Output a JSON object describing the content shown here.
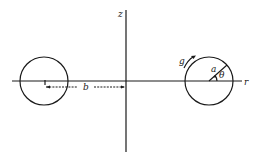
{
  "diagram": {
    "axes": {
      "vertical_label": "z",
      "horizontal_label": "r"
    },
    "left_circle": {
      "cx": 44,
      "cy": 81,
      "r": 24
    },
    "right_circle": {
      "cx": 209,
      "cy": 81,
      "r": 24
    },
    "dimension": {
      "label": "b",
      "from_x": 45,
      "to_x": 125,
      "y": 87
    },
    "right_circle_labels": {
      "flow_label": "g",
      "radius_label": "a",
      "angle_label": "θ"
    },
    "colors": {
      "line": "#1a1a1a",
      "background": "#ffffff"
    }
  }
}
